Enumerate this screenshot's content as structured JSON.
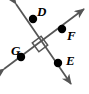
{
  "figure": {
    "kind": "geometry-diagram",
    "background_color": "#ffffff",
    "stroke_color": "#555555",
    "point_color": "#000000",
    "label_color": "#000000",
    "canvas": {
      "width": 89,
      "height": 94
    },
    "right_angle_marker": {
      "name": "right-angle-marker",
      "present": true,
      "center": {
        "x": 40,
        "y": 44
      },
      "size": 11
    },
    "intersection": {
      "x": 40,
      "y": 44
    },
    "lines": [
      {
        "name": "line-g-f",
        "label": "GF",
        "start": {
          "x": 4,
          "y": 69
        },
        "end": {
          "x": 84,
          "y": 9
        },
        "arrow_start": true,
        "arrow_end": true
      },
      {
        "name": "line-d-e",
        "label": "DE",
        "start": {
          "x": 16,
          "y": 4
        },
        "end": {
          "x": 71,
          "y": 84
        },
        "arrow_start": true,
        "arrow_end": true
      }
    ],
    "points": [
      {
        "id": "D",
        "label": "D",
        "x": 33,
        "y": 19,
        "label_x": 37,
        "label_y": 5,
        "on_line": "line-d-e"
      },
      {
        "id": "F",
        "label": "F",
        "x": 62,
        "y": 29,
        "label_x": 67,
        "label_y": 29,
        "on_line": "line-g-f"
      },
      {
        "id": "G",
        "label": "G",
        "x": 21,
        "y": 57,
        "label_x": 11,
        "label_y": 44,
        "on_line": "line-g-f"
      },
      {
        "id": "E",
        "label": "E",
        "x": 58,
        "y": 63,
        "label_x": 66,
        "label_y": 54,
        "on_line": "line-d-e"
      }
    ],
    "point_radius": 4.2
  }
}
